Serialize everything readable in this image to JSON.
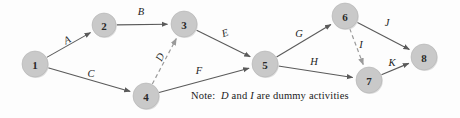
{
  "diagram": {
    "type": "directed-graph",
    "colors": {
      "node_fill": "#c9c9c9",
      "node_stroke": "#b3b3b3",
      "node_text": "#2a2a2a",
      "edge": "#5a5a5a",
      "dummy_edge": "#9a9a9a",
      "label_text": "#1c1c1c",
      "background": "#fdfdfd"
    },
    "nodes": [
      {
        "id": "1",
        "label": "1",
        "x": 35,
        "y": 64,
        "r": 13
      },
      {
        "id": "2",
        "label": "2",
        "x": 104,
        "y": 25,
        "r": 12
      },
      {
        "id": "3",
        "label": "3",
        "x": 184,
        "y": 24,
        "r": 13
      },
      {
        "id": "4",
        "label": "4",
        "x": 146,
        "y": 96,
        "r": 13
      },
      {
        "id": "5",
        "label": "5",
        "x": 265,
        "y": 64,
        "r": 13
      },
      {
        "id": "6",
        "label": "6",
        "x": 345,
        "y": 16,
        "r": 13
      },
      {
        "id": "7",
        "label": "7",
        "x": 369,
        "y": 80,
        "r": 13
      },
      {
        "id": "8",
        "label": "8",
        "x": 424,
        "y": 57,
        "r": 13
      }
    ],
    "edges": [
      {
        "label": "A",
        "from": "1",
        "to": "2",
        "style": "solid",
        "label_x": 67,
        "label_y": 40,
        "label_rotate": -27
      },
      {
        "label": "B",
        "from": "2",
        "to": "3",
        "style": "solid",
        "label_x": 141,
        "label_y": 11,
        "label_rotate": 0
      },
      {
        "label": "C",
        "from": "1",
        "to": "4",
        "style": "solid",
        "label_x": 91,
        "label_y": 73,
        "label_rotate": 0
      },
      {
        "label": "D",
        "from": "4",
        "to": "3",
        "style": "dashed",
        "label_x": 160,
        "label_y": 57,
        "label_rotate": -65
      },
      {
        "label": "E",
        "from": "3",
        "to": "5",
        "style": "solid",
        "label_x": 225,
        "label_y": 33,
        "label_rotate": -18
      },
      {
        "label": "F",
        "from": "4",
        "to": "5",
        "style": "solid",
        "label_x": 199,
        "label_y": 70,
        "label_rotate": 0
      },
      {
        "label": "G",
        "from": "5",
        "to": "6",
        "style": "solid",
        "label_x": 299,
        "label_y": 33,
        "label_rotate": 0
      },
      {
        "label": "H",
        "from": "5",
        "to": "7",
        "style": "solid",
        "label_x": 314,
        "label_y": 61,
        "label_rotate": 0
      },
      {
        "label": "I",
        "from": "6",
        "to": "7",
        "style": "dashed",
        "label_x": 361,
        "label_y": 44,
        "label_rotate": 0
      },
      {
        "label": "J",
        "from": "6",
        "to": "8",
        "style": "solid",
        "label_x": 387,
        "label_y": 22,
        "label_rotate": 0
      },
      {
        "label": "K",
        "from": "7",
        "to": "8",
        "style": "solid",
        "label_x": 392,
        "label_y": 62,
        "label_rotate": 0
      }
    ],
    "note": {
      "prefix": "Note:",
      "dummy_a": "D",
      "middle": "and",
      "dummy_b": "I",
      "suffix": "are dummy activities",
      "x": 191,
      "y": 90
    }
  }
}
